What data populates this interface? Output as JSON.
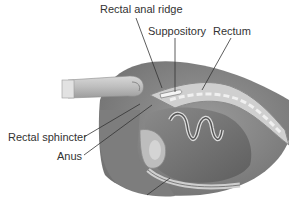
{
  "figure": {
    "labels": {
      "rectal_anal_ridge": "Rectal anal ridge",
      "suppository": "Suppository",
      "rectum": "Rectum",
      "rectal_sphincter": "Rectal sphincter",
      "anus": "Anus"
    }
  }
}
